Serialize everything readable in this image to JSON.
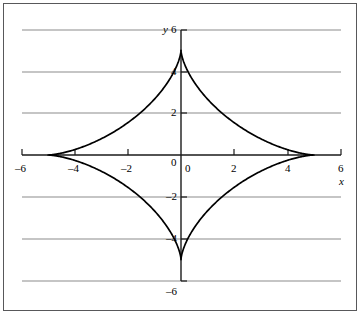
{
  "figure": {
    "background_color": "#ffffff",
    "frame_color": "#58585a",
    "axis_color": "#1a1a1a",
    "grid_color": "#8c8c8c",
    "curve_color": "#000000"
  },
  "axis_names": {
    "x": "x",
    "y": "y"
  },
  "x_labels": [
    {
      "text": "–6",
      "value": -6
    },
    {
      "text": "–4",
      "value": -4
    },
    {
      "text": "–2",
      "value": -2
    },
    {
      "text": "0",
      "value": 0
    },
    {
      "text": "2",
      "value": 2
    },
    {
      "text": "4",
      "value": 4
    },
    {
      "text": "6",
      "value": 6
    }
  ],
  "y_labels": [
    {
      "text": "6",
      "value": 6
    },
    {
      "text": "4",
      "value": 4
    },
    {
      "text": "2",
      "value": 2
    },
    {
      "text": "0",
      "value": 0
    },
    {
      "text": "–2",
      "value": -2
    },
    {
      "text": "–4",
      "value": -4
    },
    {
      "text": "–6",
      "value": -6
    }
  ],
  "chart_data": {
    "type": "line",
    "title": "",
    "subtitle": "",
    "xlabel": "x",
    "ylabel": "y",
    "xlim": [
      -6.6,
      6.6
    ],
    "ylim": [
      -6.6,
      6.6
    ],
    "xticks": [
      -6,
      -4,
      -2,
      0,
      2,
      4,
      6
    ],
    "yticks": [
      -6,
      -4,
      -2,
      0,
      2,
      4,
      6
    ],
    "grid": "horizontal",
    "gridlines_y": [
      6,
      4,
      2,
      -2,
      -4,
      -6
    ],
    "legend": null,
    "legend_position": "none",
    "annotations": [],
    "series": [
      {
        "name": "astroid",
        "equation": "x^(2/3) + y^(2/3) = 5^(2/3)",
        "closed": true,
        "cusps": [
          [
            -5,
            0
          ],
          [
            0,
            5
          ],
          [
            5,
            0
          ],
          [
            0,
            -5
          ]
        ],
        "x": [
          -5,
          -4.9,
          -4.75,
          -4.5,
          -4.2,
          -3.8,
          -3.4,
          -3,
          -2.5,
          -2,
          -1.5,
          -1,
          -0.6,
          -0.3,
          -0.1,
          0,
          0.1,
          0.3,
          0.6,
          1,
          1.5,
          2,
          2.5,
          3,
          3.4,
          3.8,
          4.2,
          4.5,
          4.75,
          4.9,
          5
        ],
        "y": [
          0,
          0.032,
          0.12,
          0.33,
          0.65,
          1.09,
          1.55,
          2.0,
          2.57,
          3.1,
          3.59,
          4.04,
          4.36,
          4.59,
          4.74,
          5,
          4.74,
          4.59,
          4.36,
          4.04,
          3.59,
          3.1,
          2.57,
          2.0,
          1.55,
          1.09,
          0.65,
          0.33,
          0.12,
          0.032,
          0
        ]
      }
    ]
  }
}
